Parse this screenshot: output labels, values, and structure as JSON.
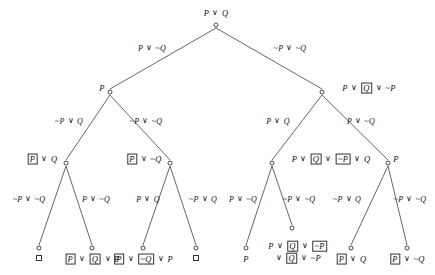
{
  "diagram": {
    "stroke_color": "#555555",
    "text_color": "#111111",
    "background": "#ffffff",
    "nodes": [
      {
        "id": "root",
        "label_html": "P <span class=\"vee\">∨</span> Q",
        "label_text": "P ∨ Q",
        "x": 216,
        "y": 25,
        "label_x": 216,
        "label_y": 13,
        "anchor": "center"
      },
      {
        "id": "n-l",
        "label_html": "P",
        "label_text": "P",
        "x": 110,
        "y": 92,
        "label_x": 102,
        "label_y": 88,
        "anchor": "center"
      },
      {
        "id": "n-r",
        "label_html": "P <span class=\"vee\">∨</span> <span class=\"boxed\">Q</span> <span class=\"vee\">∨</span> <span class=\"tilde\">~</span>P",
        "label_text": "P ∨ [Q] ∨ ~P",
        "x": 322,
        "y": 92,
        "label_x": 369,
        "label_y": 88,
        "anchor": "center"
      },
      {
        "id": "n-ll",
        "label_html": "<span class=\"boxed\">P</span> <span class=\"vee\">∨</span> Q",
        "label_text": "[P] ∨ Q",
        "x": 66,
        "y": 163,
        "label_x": 42,
        "label_y": 159,
        "anchor": "center"
      },
      {
        "id": "n-lr",
        "label_html": "<span class=\"boxed\">P</span> <span class=\"vee\">∨</span> <span class=\"tilde\">~</span>Q",
        "label_text": "[P] ∨ ~Q",
        "x": 170,
        "y": 163,
        "label_x": 144,
        "label_y": 159,
        "anchor": "center"
      },
      {
        "id": "n-rl",
        "label_html": "P <span class=\"vee\">∨</span> <span class=\"boxed\">Q</span> <span class=\"vee\">∨</span> <span class=\"boxed\"><span class=\"tilde\">~</span>P</span> <span class=\"vee\">∨</span> Q",
        "label_text": "P ∨ [Q] ∨ [~P] ∨ Q",
        "x": 272,
        "y": 163,
        "label_x": 331,
        "label_y": 159,
        "anchor": "center"
      },
      {
        "id": "n-rr",
        "label_html": "P",
        "label_text": "P",
        "x": 388,
        "y": 163,
        "label_x": 396,
        "label_y": 159,
        "anchor": "center"
      },
      {
        "id": "leaf1",
        "label_html": "",
        "label_text": "□",
        "x": 39,
        "y": 248,
        "label_x": 39,
        "label_y": 258,
        "anchor": "center",
        "empty_clause": true
      },
      {
        "id": "leaf2",
        "label_html": "<span class=\"boxed\">P</span> <span class=\"vee\">∨</span> <span class=\"boxed\">Q</span> <span class=\"vee\">∨</span> P",
        "label_text": "[P] ∨ [Q] ∨ P",
        "x": 92,
        "y": 248,
        "label_x": 92,
        "label_y": 259,
        "anchor": "center"
      },
      {
        "id": "leaf3",
        "label_html": "<span class=\"boxed\">P</span> <span class=\"vee\">∨</span> <span class=\"boxed\"><span class=\"tilde\">~</span>Q</span> <span class=\"vee\">∨</span> P",
        "label_text": "[P] ∨ [~Q] ∨ P",
        "x": 143,
        "y": 248,
        "label_x": 143,
        "label_y": 259,
        "anchor": "center"
      },
      {
        "id": "leaf4",
        "label_html": "",
        "label_text": "□",
        "x": 196,
        "y": 248,
        "label_x": 196,
        "label_y": 258,
        "anchor": "center",
        "empty_clause": true
      },
      {
        "id": "leaf5",
        "label_html": "P",
        "label_text": "P",
        "x": 246,
        "y": 248,
        "label_x": 246,
        "label_y": 259,
        "anchor": "center"
      },
      {
        "id": "leaf6",
        "label_html": "P <span class=\"vee\">∨</span> <span class=\"boxed\">Q</span> <span class=\"vee\">∨</span> <span class=\"boxed\"><span class=\"tilde\">~</span>P</span><br><span class=\"vee\">∨</span> <span class=\"boxed\">Q</span> <span class=\"vee\">∨</span> <span class=\"tilde\">~</span>P",
        "label_text": "P ∨ [Q] ∨ [~P] ∨ [Q] ∨ ~P",
        "x": 292,
        "y": 228,
        "label_x": 298,
        "label_y": 252,
        "anchor": "center"
      },
      {
        "id": "leaf7",
        "label_html": "<span class=\"boxed\">P</span> <span class=\"vee\">∨</span> Q",
        "label_text": "[P] ∨ Q",
        "x": 351,
        "y": 248,
        "label_x": 351,
        "label_y": 259,
        "anchor": "center"
      },
      {
        "id": "leaf8",
        "label_html": "<span class=\"boxed\">P</span> <span class=\"vee\">∨</span> <span class=\"tilde\">~</span>Q",
        "label_text": "[P] ∨ ~Q",
        "x": 407,
        "y": 248,
        "label_x": 407,
        "label_y": 259,
        "anchor": "center"
      }
    ],
    "edges": [
      {
        "id": "e-root-l",
        "from": "root",
        "to": "n-l",
        "label_html": "P <span class=\"vee\">∨</span> <span class=\"tilde\">~</span>Q",
        "label_text": "P ∨ ~Q",
        "label_x": 152,
        "label_y": 48,
        "align": "center"
      },
      {
        "id": "e-root-r",
        "from": "root",
        "to": "n-r",
        "label_html": "<span class=\"tilde\">~</span>P <span class=\"vee\">∨</span> <span class=\"tilde\">~</span>Q",
        "label_text": "~P ∨ ~Q",
        "label_x": 290,
        "label_y": 48,
        "align": "center"
      },
      {
        "id": "e-l-ll",
        "from": "n-l",
        "to": "n-ll",
        "label_html": "<span class=\"tilde\">~</span>P <span class=\"vee\">∨</span> Q",
        "label_text": "~P ∨ Q",
        "label_x": 69,
        "label_y": 121,
        "align": "center"
      },
      {
        "id": "e-l-lr",
        "from": "n-l",
        "to": "n-lr",
        "label_html": "<span class=\"tilde\">~</span>P <span class=\"vee\">∨</span> <span class=\"tilde\">~</span>Q",
        "label_text": "~P ∨ ~Q",
        "label_x": 146,
        "label_y": 121,
        "align": "center"
      },
      {
        "id": "e-r-rl",
        "from": "n-r",
        "to": "n-rl",
        "label_html": "P <span class=\"vee\">∨</span> Q",
        "label_text": "P ∨ Q",
        "label_x": 278,
        "label_y": 121,
        "align": "center"
      },
      {
        "id": "e-r-rr",
        "from": "n-r",
        "to": "n-rr",
        "label_html": "P <span class=\"vee\">∨</span> <span class=\"tilde\">~</span>Q",
        "label_text": "P ∨ ~Q",
        "label_x": 361,
        "label_y": 121,
        "align": "center"
      },
      {
        "id": "e-ll-1",
        "from": "n-ll",
        "to": "leaf1",
        "label_html": "<span class=\"tilde\">~</span>P <span class=\"vee\">∨</span> <span class=\"tilde\">~</span>Q",
        "label_text": "~P ∨ ~Q",
        "label_x": 29,
        "label_y": 199,
        "align": "center"
      },
      {
        "id": "e-ll-2",
        "from": "n-ll",
        "to": "leaf2",
        "label_html": "P <span class=\"vee\">∨</span> <span class=\"tilde\">~</span>Q",
        "label_text": "P ∨ ~Q",
        "label_x": 96,
        "label_y": 199,
        "align": "center"
      },
      {
        "id": "e-lr-3",
        "from": "n-lr",
        "to": "leaf3",
        "label_html": "P <span class=\"vee\">∨</span> Q",
        "label_text": "P ∨ Q",
        "label_x": 148,
        "label_y": 199,
        "align": "center"
      },
      {
        "id": "e-lr-4",
        "from": "n-lr",
        "to": "leaf4",
        "label_html": "<span class=\"tilde\">~</span>P <span class=\"vee\">∨</span> Q",
        "label_text": "~P ∨ Q",
        "label_x": 203,
        "label_y": 199,
        "align": "center"
      },
      {
        "id": "e-rl-5",
        "from": "n-rl",
        "to": "leaf5",
        "label_html": "P <span class=\"vee\">∨</span> <span class=\"tilde\">~</span>Q",
        "label_text": "P ∨ ~Q",
        "label_x": 243,
        "label_y": 199,
        "align": "center"
      },
      {
        "id": "e-rl-6",
        "from": "n-rl",
        "to": "leaf6",
        "label_html": "<span class=\"tilde\">~</span>P <span class=\"vee\">∨</span> <span class=\"tilde\">~</span>Q",
        "label_text": "~P ∨ ~Q",
        "label_x": 299,
        "label_y": 199,
        "align": "center"
      },
      {
        "id": "e-rr-7",
        "from": "n-rr",
        "to": "leaf7",
        "label_html": "<span class=\"tilde\">~</span>P <span class=\"vee\">∨</span> Q",
        "label_text": "~P ∨ Q",
        "label_x": 347,
        "label_y": 199,
        "align": "center"
      },
      {
        "id": "e-rr-8",
        "from": "n-rr",
        "to": "leaf8",
        "label_html": "<span class=\"tilde\">~</span>P <span class=\"vee\">∨</span> <span class=\"tilde\">~</span>Q",
        "label_text": "~P ∨ ~Q",
        "label_x": 410,
        "label_y": 199,
        "align": "center"
      }
    ]
  }
}
